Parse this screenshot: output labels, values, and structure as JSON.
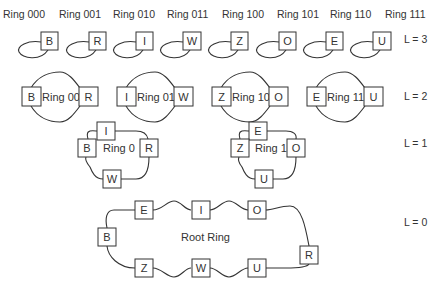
{
  "level3": {
    "level_label": "L = 3",
    "rings": [
      {
        "ring_label": "Ring 000",
        "node": "B"
      },
      {
        "ring_label": "Ring 001",
        "node": "R"
      },
      {
        "ring_label": "Ring 010",
        "node": "I"
      },
      {
        "ring_label": "Ring 011",
        "node": "W"
      },
      {
        "ring_label": "Ring 100",
        "node": "Z"
      },
      {
        "ring_label": "Ring 101",
        "node": "O"
      },
      {
        "ring_label": "Ring 110",
        "node": "E"
      },
      {
        "ring_label": "Ring 111",
        "node": "U"
      }
    ]
  },
  "level2": {
    "level_label": "L = 2",
    "rings": [
      {
        "ring_label": "Ring 00",
        "nodes": [
          "B",
          "R"
        ]
      },
      {
        "ring_label": "Ring 01",
        "nodes": [
          "I",
          "W"
        ]
      },
      {
        "ring_label": "Ring 10",
        "nodes": [
          "Z",
          "O"
        ]
      },
      {
        "ring_label": "Ring 11",
        "nodes": [
          "E",
          "U"
        ]
      }
    ]
  },
  "level1": {
    "level_label": "L = 1",
    "rings": [
      {
        "ring_label": "Ring 0",
        "nodes": [
          "I",
          "B",
          "R",
          "W"
        ]
      },
      {
        "ring_label": "Ring 1",
        "nodes": [
          "E",
          "Z",
          "O",
          "U"
        ]
      }
    ]
  },
  "level0": {
    "level_label": "L = 0",
    "ring_label": "Root Ring",
    "nodes": [
      "E",
      "I",
      "O",
      "B",
      "R",
      "Z",
      "W",
      "U"
    ]
  }
}
